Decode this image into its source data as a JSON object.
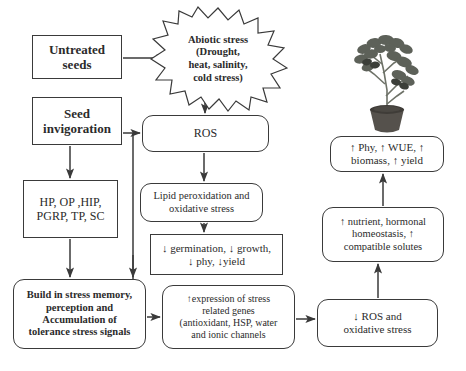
{
  "diagram": {
    "type": "flowchart",
    "nodes": {
      "untreated_seeds": "Untreated seeds",
      "seed_invigoration": "Seed invigoration",
      "hormones": "HP, OP ,HIP, PGRP, TP, SC",
      "abiotic_stress": "Abiotic stress (Drought, heat, salinity, cold stress)",
      "ros": "ROS",
      "lipid_peroxidation": "Lipid peroxidation and oxidative stress",
      "reduced_growth": "↓ germination, ↓ growth, ↓ phy, ↓yield",
      "stress_memory": "Build in stress memory, perception and Accumulation of tolerance stress signals",
      "gene_expression": "↑expression of stress related genes (antioxidant, HSP, water and ionic channels",
      "reduced_ros": "↓ ROS and oxidative stress",
      "nutrient_homeostasis": "↑ nutrient, hormonal homeostasis, ↑ compatible solutes",
      "improved_traits": "↑ Phy, ↑ WUE, ↑ biomass, ↑ yield",
      "plant_photo_caption": "healthy potted plant"
    },
    "node_lines": {
      "untreated_seeds": [
        "Untreated",
        "seeds"
      ],
      "seed_invigoration": [
        "Seed",
        "invigoration"
      ],
      "hormones": [
        "HP, OP ,HIP,",
        "PGRP, TP, SC"
      ],
      "abiotic_stress": [
        "Abiotic stress",
        "(Drought,",
        "heat, salinity,",
        "cold stress)"
      ],
      "ros": [
        "ROS"
      ],
      "lipid_peroxidation": [
        "Lipid peroxidation and",
        "oxidative stress"
      ],
      "reduced_growth": [
        "↓ germination, ↓ growth,",
        "↓ phy, ↓yield"
      ],
      "stress_memory": [
        "Build in stress memory,",
        "perception and",
        "Accumulation of",
        "tolerance stress signals"
      ],
      "gene_expression": [
        "↑expression of stress",
        "related genes",
        "(antioxidant, HSP, water",
        "and ionic channels"
      ],
      "reduced_ros": [
        "↓ ROS and",
        "oxidative stress"
      ],
      "nutrient_homeostasis": [
        "↑ nutrient, hormonal",
        "homeostasis, ↑",
        "compatible solutes"
      ],
      "improved_traits": [
        "↑ Phy, ↑ WUE, ↑",
        "biomass, ↑ yield"
      ]
    },
    "edges": [
      {
        "from": "untreated_seeds",
        "to": "abiotic_stress"
      },
      {
        "from": "abiotic_stress",
        "to": "ros"
      },
      {
        "from": "seed_invigoration",
        "to": "ros"
      },
      {
        "from": "seed_invigoration",
        "to": "hormones"
      },
      {
        "from": "seed_invigoration",
        "to": "stress_memory"
      },
      {
        "from": "hormones",
        "to": "stress_memory"
      },
      {
        "from": "ros",
        "to": "lipid_peroxidation"
      },
      {
        "from": "lipid_peroxidation",
        "to": "reduced_growth"
      },
      {
        "from": "stress_memory",
        "to": "gene_expression"
      },
      {
        "from": "gene_expression",
        "to": "reduced_ros"
      },
      {
        "from": "reduced_ros",
        "to": "nutrient_homeostasis"
      },
      {
        "from": "nutrient_homeostasis",
        "to": "improved_traits"
      }
    ],
    "colors": {
      "stroke": "#3a3a3a",
      "text": "#2b2b2b",
      "background": "#ffffff",
      "plant_leaf": "#5d6159",
      "plant_pot": "#55514c"
    }
  }
}
